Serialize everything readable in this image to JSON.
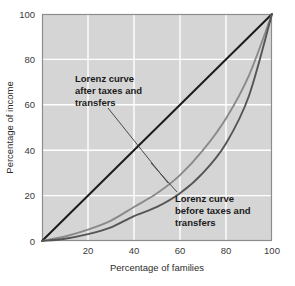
{
  "chart_data": {
    "type": "line",
    "title": "",
    "xlabel": "Percentage of families",
    "ylabel": "Percentage of income",
    "xlim": [
      0,
      100
    ],
    "ylim": [
      0,
      100
    ],
    "xticks": [
      20,
      40,
      60,
      80,
      100
    ],
    "xtick_labels": [
      "20",
      "40",
      "60",
      "80",
      "100"
    ],
    "yticks": [
      0,
      20,
      40,
      60,
      80,
      100
    ],
    "ytick_labels": [
      "0",
      "20",
      "40",
      "60",
      "80",
      "100"
    ],
    "grid": true,
    "grid_color": "#ffffff",
    "plot_background": "#d5d5d5",
    "legend": "none",
    "series": [
      {
        "name": "Line of equality",
        "color": "#1c1c1c",
        "x": [
          0,
          100
        ],
        "values": [
          0,
          100
        ]
      },
      {
        "name": "Lorenz curve after taxes and transfers",
        "color": "#8a8a8a",
        "x": [
          0,
          10,
          20,
          30,
          40,
          50,
          60,
          70,
          80,
          90,
          100
        ],
        "values": [
          0,
          2,
          5,
          9,
          15,
          21,
          29,
          40,
          54,
          73,
          100
        ]
      },
      {
        "name": "Lorenz curve before taxes and transfers",
        "color": "#555555",
        "x": [
          0,
          10,
          20,
          30,
          40,
          50,
          60,
          70,
          80,
          90,
          100
        ],
        "values": [
          0,
          1,
          3,
          6,
          11,
          15,
          21,
          30,
          43,
          64,
          100
        ]
      }
    ],
    "annotations": [
      {
        "id": "after-taxes",
        "lines": [
          "Lorenz curve",
          "after taxes and",
          "transfers"
        ],
        "text_x": 75,
        "text_y": 82,
        "leader_from_x": 108,
        "leader_from_y": 108,
        "leader_to_x": 168,
        "leader_to_y": 183
      },
      {
        "id": "before-taxes",
        "lines": [
          "Lorenz curve",
          "before taxes and",
          "transfers"
        ],
        "text_x": 175,
        "text_y": 202,
        "leader_from_x": 177,
        "leader_from_y": 192,
        "leader_to_x": 151,
        "leader_to_y": 163
      }
    ]
  },
  "axes": {
    "x_title": "Percentage of families",
    "y_title": "Percentage of income"
  }
}
